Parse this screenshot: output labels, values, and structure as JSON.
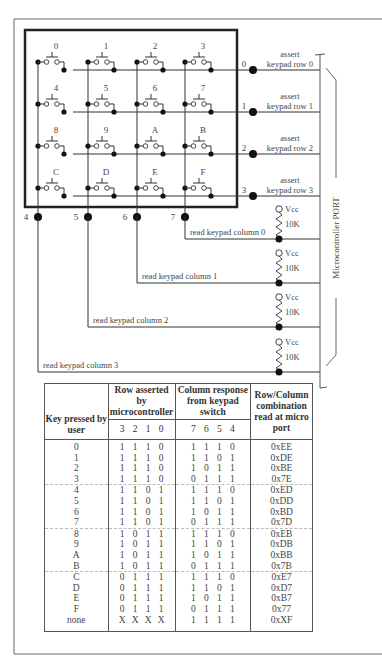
{
  "keypad": {
    "keys": [
      [
        "0",
        "1",
        "2",
        "3"
      ],
      [
        "4",
        "5",
        "6",
        "7"
      ],
      [
        "8",
        "9",
        "A",
        "B"
      ],
      [
        "C",
        "D",
        "E",
        "F"
      ]
    ]
  },
  "port": {
    "label": "Microcontroller PORT",
    "row_pins": [
      "0",
      "1",
      "2",
      "3"
    ],
    "column_pins": [
      "4",
      "5",
      "6",
      "7"
    ],
    "row_labels": [
      {
        "line1": "assert",
        "line2": "keypad row 0"
      },
      {
        "line1": "assert",
        "line2": "keypad row 1"
      },
      {
        "line1": "assert",
        "line2": "keypad row 2"
      },
      {
        "line1": "assert",
        "line2": "keypad row 3"
      }
    ],
    "column_labels": [
      "read keypad column 0",
      "read keypad column 1",
      "read keypad column 2",
      "read keypad column 3"
    ],
    "pullup": {
      "supply": "Vcc",
      "value": "10K"
    }
  },
  "table": {
    "headers": {
      "key": "Key pressed by user",
      "row": "Row asserted by microcontroller",
      "column": "Column response from keypad switch",
      "combo": "Row/Column combination read at micro port"
    },
    "row_bits": [
      "3",
      "2",
      "1",
      "0"
    ],
    "column_bits": [
      "7",
      "6",
      "5",
      "4"
    ],
    "rows": [
      {
        "key": "0",
        "row": [
          "1",
          "1",
          "1",
          "0"
        ],
        "col": [
          "1",
          "1",
          "1",
          "0"
        ],
        "combo": "0xEE"
      },
      {
        "key": "1",
        "row": [
          "1",
          "1",
          "1",
          "0"
        ],
        "col": [
          "1",
          "1",
          "0",
          "1"
        ],
        "combo": "0xDE"
      },
      {
        "key": "2",
        "row": [
          "1",
          "1",
          "1",
          "0"
        ],
        "col": [
          "1",
          "0",
          "1",
          "1"
        ],
        "combo": "0xBE"
      },
      {
        "key": "3",
        "row": [
          "1",
          "1",
          "1",
          "0"
        ],
        "col": [
          "0",
          "1",
          "1",
          "1"
        ],
        "combo": "0x7E"
      },
      {
        "key": "4",
        "row": [
          "1",
          "1",
          "0",
          "1"
        ],
        "col": [
          "1",
          "1",
          "1",
          "0"
        ],
        "combo": "0xED"
      },
      {
        "key": "5",
        "row": [
          "1",
          "1",
          "0",
          "1"
        ],
        "col": [
          "1",
          "1",
          "0",
          "1"
        ],
        "combo": "0xDD"
      },
      {
        "key": "6",
        "row": [
          "1",
          "1",
          "0",
          "1"
        ],
        "col": [
          "1",
          "0",
          "1",
          "1"
        ],
        "combo": "0xBD"
      },
      {
        "key": "7",
        "row": [
          "1",
          "1",
          "0",
          "1"
        ],
        "col": [
          "0",
          "1",
          "1",
          "1"
        ],
        "combo": "0x7D"
      },
      {
        "key": "8",
        "row": [
          "1",
          "0",
          "1",
          "1"
        ],
        "col": [
          "1",
          "1",
          "1",
          "0"
        ],
        "combo": "0xEB"
      },
      {
        "key": "9",
        "row": [
          "1",
          "0",
          "1",
          "1"
        ],
        "col": [
          "1",
          "1",
          "0",
          "1"
        ],
        "combo": "0xDB"
      },
      {
        "key": "A",
        "row": [
          "1",
          "0",
          "1",
          "1"
        ],
        "col": [
          "1",
          "0",
          "1",
          "1"
        ],
        "combo": "0xBB"
      },
      {
        "key": "B",
        "row": [
          "1",
          "0",
          "1",
          "1"
        ],
        "col": [
          "0",
          "1",
          "1",
          "1"
        ],
        "combo": "0x7B"
      },
      {
        "key": "C",
        "row": [
          "0",
          "1",
          "1",
          "1"
        ],
        "col": [
          "1",
          "1",
          "1",
          "0"
        ],
        "combo": "0xE7"
      },
      {
        "key": "D",
        "row": [
          "0",
          "1",
          "1",
          "1"
        ],
        "col": [
          "1",
          "1",
          "0",
          "1"
        ],
        "combo": "0xD7"
      },
      {
        "key": "E",
        "row": [
          "0",
          "1",
          "1",
          "1"
        ],
        "col": [
          "1",
          "0",
          "1",
          "1"
        ],
        "combo": "0xB7"
      },
      {
        "key": "F",
        "row": [
          "0",
          "1",
          "1",
          "1"
        ],
        "col": [
          "0",
          "1",
          "1",
          "1"
        ],
        "combo": "0x77"
      },
      {
        "key": "none",
        "row": [
          "X",
          "X",
          "X",
          "X"
        ],
        "col": [
          "1",
          "1",
          "1",
          "1"
        ],
        "combo": "0xXF"
      }
    ]
  }
}
